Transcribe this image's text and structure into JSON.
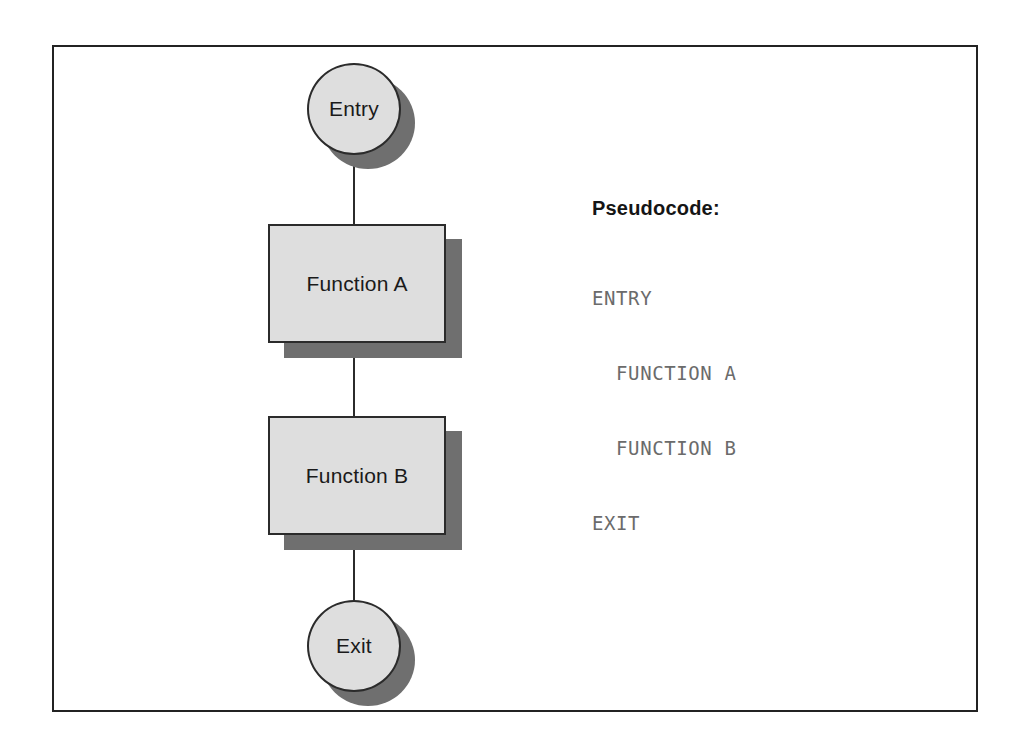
{
  "diagram": {
    "frame": {
      "border_color": "#232323",
      "background": "#ffffff"
    },
    "palette": {
      "node_fill": "#dedede",
      "node_border": "#2b2b2b",
      "node_shadow": "#6f6f6f",
      "connector": "#2b2b2b",
      "heading_text": "#151515",
      "code_text": "#6b6b6b"
    },
    "nodes": [
      {
        "id": "entry",
        "type": "terminator",
        "label": "Entry"
      },
      {
        "id": "function-a",
        "type": "process",
        "label": "Function A"
      },
      {
        "id": "function-b",
        "type": "process",
        "label": "Function B"
      },
      {
        "id": "exit",
        "type": "terminator",
        "label": "Exit"
      }
    ],
    "connectors": [
      {
        "from": "entry",
        "to": "function-a"
      },
      {
        "from": "function-a",
        "to": "function-b"
      },
      {
        "from": "function-b",
        "to": "exit"
      }
    ]
  },
  "pseudocode": {
    "heading": "Pseudocode:",
    "lines": [
      "ENTRY",
      "  FUNCTION A",
      "  FUNCTION B",
      "EXIT"
    ]
  }
}
